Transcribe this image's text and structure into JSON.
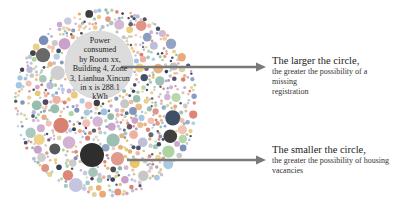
{
  "bubble_chart": {
    "center_label": "Power consumed by Room xx, Building 4, Zone 3, Lianhua Xincun in x is 288.1 kWh",
    "center_label_lines": [
      "Power",
      "consumed",
      "by Room xx,",
      "Building 4, Zone",
      "3, Lianhua Xincun",
      "in x is 288.1",
      "kWh"
    ],
    "palette": [
      "#e8a66a",
      "#c9a0c8",
      "#9fc3e0",
      "#a9cf9a",
      "#e9c46a",
      "#f0b0a0",
      "#b8b8d8",
      "#8fb8a8",
      "#d87c6c",
      "#7a8fb8",
      "#c4c4c4",
      "#e0d0a0"
    ],
    "dark_colors": [
      "#3a3a3a",
      "#4a3550",
      "#2f4058"
    ],
    "highlight_circle_color": "#d9d9d9",
    "large_dark_circle_color": "#2e2e2e"
  },
  "annotations": [
    {
      "title": "The larger the circle,",
      "subtitle_lines": [
        "the greater the possibility of a missing",
        "registration"
      ]
    },
    {
      "title": "The smaller the circle,",
      "subtitle_lines": [
        "the greater the possibility of housing",
        "vacancies"
      ]
    }
  ],
  "arrow_color": "#7a7a7a"
}
